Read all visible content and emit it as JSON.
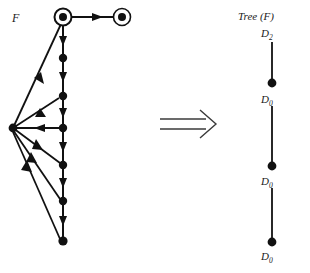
{
  "figure": {
    "width": 310,
    "height": 273,
    "background": "#ffffff",
    "ink_color": "#111111",
    "caption_left": "F",
    "caption_right": "Tree (F)",
    "relation_symbol": "double-right-arrow"
  },
  "left_graph": {
    "name": "F",
    "label": "F",
    "description": "Directed flow graph with two accepting (double-circle) nodes at top, a vertical spine of plain nodes, and a left hub node receiving and emitting many edges.",
    "nodes": [
      {
        "id": "n_entry",
        "label": "",
        "type": "double-circle",
        "x": 63,
        "y": 17
      },
      {
        "id": "n_exit",
        "label": "",
        "type": "double-circle",
        "x": 122,
        "y": 17
      },
      {
        "id": "n_s1",
        "label": "",
        "type": "dot",
        "x": 63,
        "y": 58
      },
      {
        "id": "n_s2",
        "label": "",
        "type": "dot",
        "x": 63,
        "y": 96
      },
      {
        "id": "n_s3",
        "label": "",
        "type": "dot",
        "x": 63,
        "y": 128
      },
      {
        "id": "n_s4",
        "label": "",
        "type": "dot",
        "x": 63,
        "y": 165
      },
      {
        "id": "n_s5",
        "label": "",
        "type": "dot",
        "x": 63,
        "y": 201
      },
      {
        "id": "n_s6",
        "label": "",
        "type": "dot",
        "x": 63,
        "y": 241
      },
      {
        "id": "n_hub",
        "label": "",
        "type": "dot",
        "x": 13,
        "y": 128
      }
    ],
    "edges": [
      {
        "from": "n_entry",
        "to": "n_exit",
        "kind": "horizontal-forward"
      },
      {
        "from": "n_entry",
        "to": "n_s1",
        "kind": "spine-forward"
      },
      {
        "from": "n_s1",
        "to": "n_s2",
        "kind": "spine-forward"
      },
      {
        "from": "n_s2",
        "to": "n_s3",
        "kind": "spine-forward"
      },
      {
        "from": "n_s3",
        "to": "n_s4",
        "kind": "spine-forward"
      },
      {
        "from": "n_s4",
        "to": "n_s5",
        "kind": "spine-forward"
      },
      {
        "from": "n_s5",
        "to": "n_s6",
        "kind": "spine-forward"
      },
      {
        "from": "n_entry",
        "to": "n_hub",
        "kind": "back-edge"
      },
      {
        "from": "n_s2",
        "to": "n_hub",
        "kind": "back-edge"
      },
      {
        "from": "n_s3",
        "to": "n_hub",
        "kind": "back-edge-horizontal"
      },
      {
        "from": "n_hub",
        "to": "n_s4",
        "kind": "forward-fan"
      },
      {
        "from": "n_hub",
        "to": "n_s5",
        "kind": "forward-fan"
      },
      {
        "from": "n_hub",
        "to": "n_s6",
        "kind": "forward-fan"
      }
    ]
  },
  "right_tree": {
    "name": "Tree (F)",
    "label": "Tree (F)",
    "description": "Derived tree: a single vertical path of three dot nodes annotated with interval-derived-sequence labels.",
    "nodes": [
      {
        "id": "t1",
        "label": "D",
        "sub": "2",
        "label_text": "D2",
        "x": 272,
        "y": 30,
        "type": "label-only"
      },
      {
        "id": "t2",
        "label": "D",
        "sub": "0",
        "label_text": "D0",
        "x": 272,
        "y": 83,
        "type": "dot"
      },
      {
        "id": "t3",
        "label": "D",
        "sub": "0",
        "label_text": "D0",
        "x": 272,
        "y": 166,
        "type": "dot"
      },
      {
        "id": "t4",
        "label": "D",
        "sub": "0",
        "label_text": "D0",
        "x": 272,
        "y": 242,
        "type": "dot"
      }
    ],
    "edges": [
      {
        "from": "t1",
        "to": "t2"
      },
      {
        "from": "t2",
        "to": "t3"
      },
      {
        "from": "t3",
        "to": "t4"
      }
    ]
  },
  "arrow": {
    "symbol": "⟹",
    "x1": 160,
    "x2": 216,
    "y": 124
  }
}
